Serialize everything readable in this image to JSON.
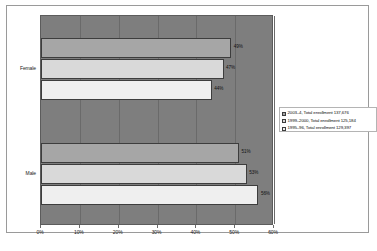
{
  "chart_data": {
    "type": "bar",
    "orientation": "horizontal",
    "title": "",
    "subtitle": "",
    "xlabel": "",
    "ylabel": "",
    "categories": [
      "Female",
      "Male"
    ],
    "xlim": [
      0,
      60
    ],
    "xticks": [
      "0%",
      "10%",
      "20%",
      "30%",
      "40%",
      "50%",
      "60%"
    ],
    "xtick_values": [
      0,
      10,
      20,
      30,
      40,
      50,
      60
    ],
    "grid": true,
    "legend_position": "right",
    "series": [
      {
        "name": "2003–4, Total enrollment 137,676",
        "color": "#a6a6a6",
        "values": [
          49,
          51
        ],
        "labels": [
          "49%",
          "51%"
        ]
      },
      {
        "name": "1999–2000, Total enrollment 125,184",
        "color": "#d9d9d9",
        "values": [
          47,
          53
        ],
        "labels": [
          "47%",
          "53%"
        ]
      },
      {
        "name": "1995–96, Total enrollment 129,397",
        "color": "#efefef",
        "values": [
          44,
          56
        ],
        "labels": [
          "44%",
          "56%"
        ]
      }
    ]
  },
  "legend": {
    "items": [
      {
        "label": "2003–4, Total enrollment 137,676"
      },
      {
        "label": "1999–2000, Total enrollment 125,184"
      },
      {
        "label": "1995–96, Total enrollment 129,397"
      }
    ]
  },
  "axis": {
    "category_labels": [
      "Female",
      "Male"
    ],
    "tick_labels": [
      "0%",
      "10%",
      "20%",
      "30%",
      "40%",
      "50%",
      "60%"
    ]
  },
  "caption": {
    "text": ""
  }
}
